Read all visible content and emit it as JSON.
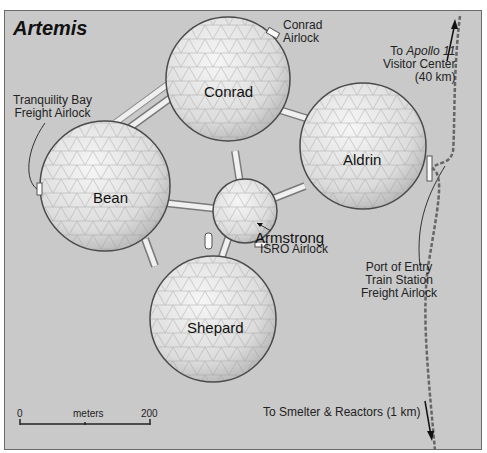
{
  "map": {
    "title": "Artemis",
    "domes": [
      {
        "name": "Conrad"
      },
      {
        "name": "Aldrin"
      },
      {
        "name": "Bean"
      },
      {
        "name": "Armstrong"
      },
      {
        "name": "Shepard"
      }
    ],
    "labels": {
      "tranquility_line1": "Tranquility Bay",
      "tranquility_line2": "Freight Airlock",
      "conrad_airlock_line1": "Conrad",
      "conrad_airlock_line2": "Airlock",
      "apollo_line1_prefix": "To ",
      "apollo_line1_italic": "Apollo 11",
      "apollo_line2": "Visitor Center",
      "apollo_line3": "(40 km)",
      "isro_airlock": "ISRO Airlock",
      "port_line1": "Port of Entry",
      "port_line2": "Train Station",
      "port_line3": "Freight Airlock",
      "smelter": "To Smelter & Reactors (1 km)"
    },
    "scale": {
      "start": "0",
      "unit": "meters",
      "end": "200"
    },
    "colors": {
      "ground": "#c9c9c9",
      "dome": "#e4e4e4",
      "dome_outline": "#4a4a4a",
      "track": "#666666"
    }
  }
}
